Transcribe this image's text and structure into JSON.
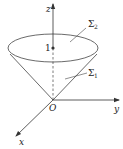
{
  "diagram": {
    "axes": {
      "z_label": "z",
      "y_label": "y",
      "x_label": "x",
      "origin_label": "O"
    },
    "surfaces": [
      {
        "symbol": "Σ",
        "subscript": "2",
        "description": "top disk"
      },
      {
        "symbol": "Σ",
        "subscript": "1",
        "description": "cone lateral surface"
      }
    ],
    "point_label": "1",
    "colors": {
      "stroke": "#333333",
      "text": "#222222",
      "background": "#ffffff"
    }
  }
}
